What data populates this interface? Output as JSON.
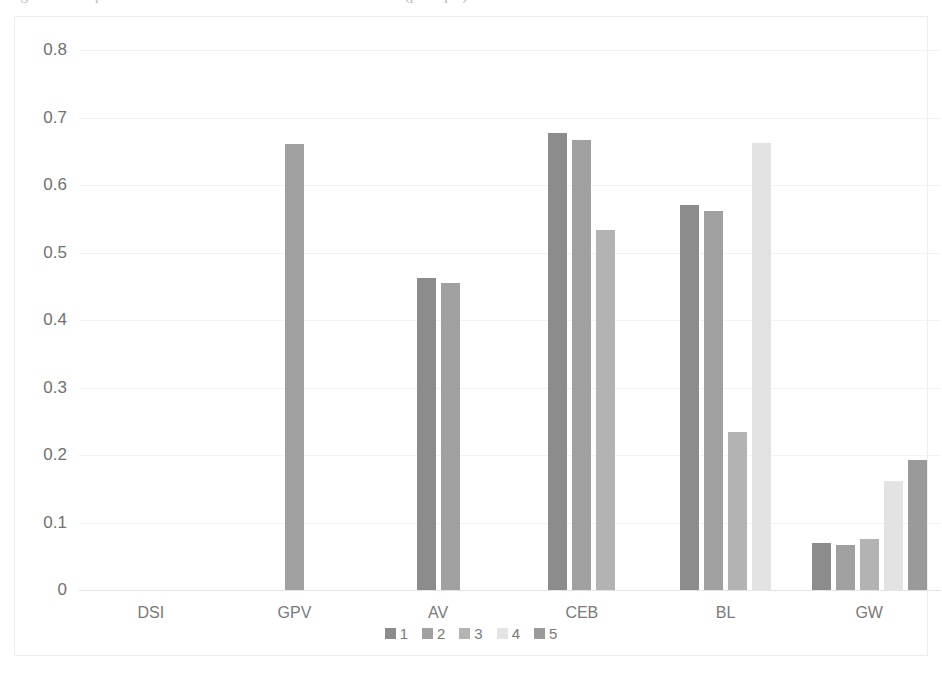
{
  "caption_sliver": "Figure 3. Comparison of retrieval effectiveness across collections (per topic).",
  "chart_data": {
    "type": "bar",
    "title": "",
    "subtitle": "",
    "xlabel": "",
    "ylabel": "",
    "categories": [
      "DSI",
      "GPV",
      "AV",
      "CEB",
      "BL",
      "GW"
    ],
    "series": [
      {
        "name": "1",
        "color": "#8c8c8c",
        "values": [
          null,
          null,
          0.462,
          0.677,
          0.57,
          0.07
        ]
      },
      {
        "name": "2",
        "color": "#a0a0a0",
        "values": [
          null,
          0.661,
          0.455,
          0.667,
          0.562,
          0.066
        ]
      },
      {
        "name": "3",
        "color": "#b3b3b3",
        "values": [
          null,
          null,
          null,
          0.534,
          0.234,
          0.076
        ]
      },
      {
        "name": "4",
        "color": "#e3e3e3",
        "values": [
          null,
          null,
          null,
          null,
          0.662,
          0.162
        ]
      },
      {
        "name": "5",
        "color": "#9a9a9a",
        "values": [
          null,
          null,
          null,
          null,
          null,
          0.193
        ]
      }
    ],
    "ylim": [
      0,
      0.8
    ],
    "ytick_values": [
      0.8,
      0.7,
      0.6,
      0.5,
      0.4,
      0.3,
      0.2,
      0.1,
      0
    ],
    "ytick_labels": [
      "0.8",
      "0.7",
      "0.6",
      "0.5",
      "0.4",
      "0.3",
      "0.2",
      "0.1",
      "0"
    ],
    "grid": true,
    "grid_axis": "y",
    "legend_position": "bottom",
    "legend_entries": [
      "1",
      "2",
      "3",
      "4",
      "5"
    ],
    "plot_background": "#ffffff",
    "gridline_color": "#f2f2f2",
    "axis_color": "#e3e3e3",
    "text_color": "#7a7a7a"
  }
}
